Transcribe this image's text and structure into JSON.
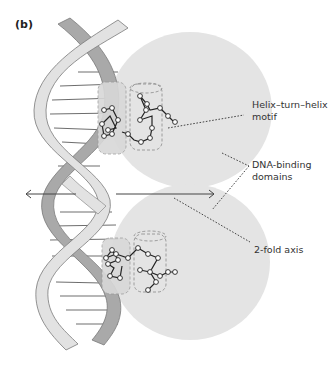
{
  "figure": {
    "panel_label": "(b)",
    "labels": {
      "hth_line1": "Helix–turn–helix",
      "hth_line2": "motif",
      "dbd_line1": "DNA-binding",
      "dbd_line2": "domains",
      "axis": "2-fold axis"
    },
    "colors": {
      "domain_fill": "#e4e4e4",
      "strand_light": "#e2e2e2",
      "strand_dark": "#a9a9a9",
      "strand_outline": "#7a7a7a",
      "base_pair": "#6e6e6e",
      "leader_line": "#444444",
      "text": "#333333"
    }
  }
}
